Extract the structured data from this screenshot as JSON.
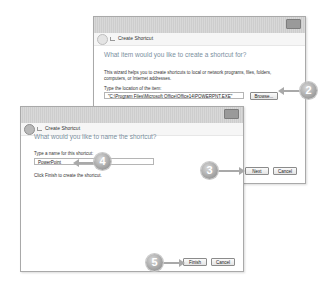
{
  "back_window": {
    "title": "Create Shortcut",
    "heading": "What item would you like to create a shortcut for?",
    "description": "This wizard helps you to create shortcuts to local or network programs, files, folders, computers, or Internet addresses.",
    "location_label": "Type the location of the item:",
    "location_value": "\"C:\\Program Files\\Microsoft Office\\Office14\\POWERPNT.EXE\"",
    "browse_label": "Browse...",
    "next_label": "Next",
    "cancel_label": "Cancel"
  },
  "front_window": {
    "title": "Create Shortcut",
    "heading": "What would you like to name the shortcut?",
    "name_label": "Type a name for this shortcut:",
    "name_value": "PowerPoint",
    "instruction": "Click Finish to create the shortcut.",
    "finish_label": "Finish",
    "cancel_label": "Cancel"
  },
  "callouts": {
    "step2": "2",
    "step3": "3",
    "step4": "4",
    "step5": "5"
  }
}
